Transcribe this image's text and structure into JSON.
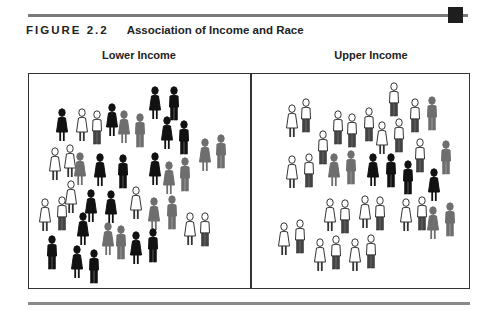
{
  "figure": {
    "number": "FIGURE 2.2",
    "title": "Association of Income and Race"
  },
  "colors": {
    "white": "#ffffff",
    "gray": "#6e6e6e",
    "black": "#111111",
    "outline": "#333333"
  },
  "panels": [
    {
      "label": "Lower Income",
      "people": [
        {
          "x": 62,
          "y": 108,
          "c": "black",
          "s": "dress"
        },
        {
          "x": 82,
          "y": 108,
          "c": "white",
          "s": "dress"
        },
        {
          "x": 97,
          "y": 110,
          "c": "white",
          "s": "pants"
        },
        {
          "x": 112,
          "y": 103,
          "c": "black",
          "s": "dress"
        },
        {
          "x": 124,
          "y": 110,
          "c": "gray",
          "s": "dress"
        },
        {
          "x": 140,
          "y": 113,
          "c": "gray",
          "s": "pants"
        },
        {
          "x": 155,
          "y": 86,
          "c": "black",
          "s": "dress"
        },
        {
          "x": 174,
          "y": 86,
          "c": "black",
          "s": "pants"
        },
        {
          "x": 167,
          "y": 116,
          "c": "black",
          "s": "dress"
        },
        {
          "x": 184,
          "y": 120,
          "c": "black",
          "s": "pants"
        },
        {
          "x": 205,
          "y": 138,
          "c": "gray",
          "s": "dress"
        },
        {
          "x": 221,
          "y": 134,
          "c": "gray",
          "s": "pants"
        },
        {
          "x": 55,
          "y": 147,
          "c": "white",
          "s": "dress"
        },
        {
          "x": 70,
          "y": 144,
          "c": "white",
          "s": "dress"
        },
        {
          "x": 80,
          "y": 152,
          "c": "gray",
          "s": "dress"
        },
        {
          "x": 100,
          "y": 153,
          "c": "black",
          "s": "dress"
        },
        {
          "x": 123,
          "y": 154,
          "c": "black",
          "s": "pants"
        },
        {
          "x": 155,
          "y": 152,
          "c": "black",
          "s": "dress"
        },
        {
          "x": 169,
          "y": 161,
          "c": "gray",
          "s": "dress"
        },
        {
          "x": 185,
          "y": 157,
          "c": "gray",
          "s": "pants"
        },
        {
          "x": 71,
          "y": 180,
          "c": "white",
          "s": "dress"
        },
        {
          "x": 91,
          "y": 189,
          "c": "black",
          "s": "dress"
        },
        {
          "x": 111,
          "y": 190,
          "c": "black",
          "s": "dress"
        },
        {
          "x": 136,
          "y": 186,
          "c": "white",
          "s": "dress"
        },
        {
          "x": 45,
          "y": 198,
          "c": "white",
          "s": "dress"
        },
        {
          "x": 62,
          "y": 196,
          "c": "white",
          "s": "pants"
        },
        {
          "x": 154,
          "y": 197,
          "c": "gray",
          "s": "dress"
        },
        {
          "x": 172,
          "y": 195,
          "c": "gray",
          "s": "pants"
        },
        {
          "x": 83,
          "y": 212,
          "c": "black",
          "s": "dress"
        },
        {
          "x": 108,
          "y": 222,
          "c": "gray",
          "s": "dress"
        },
        {
          "x": 121,
          "y": 225,
          "c": "gray",
          "s": "pants"
        },
        {
          "x": 136,
          "y": 231,
          "c": "black",
          "s": "dress"
        },
        {
          "x": 153,
          "y": 228,
          "c": "black",
          "s": "pants"
        },
        {
          "x": 190,
          "y": 212,
          "c": "white",
          "s": "dress"
        },
        {
          "x": 205,
          "y": 212,
          "c": "white",
          "s": "pants"
        },
        {
          "x": 52,
          "y": 235,
          "c": "black",
          "s": "pants"
        },
        {
          "x": 77,
          "y": 245,
          "c": "black",
          "s": "dress"
        },
        {
          "x": 94,
          "y": 249,
          "c": "black",
          "s": "pants"
        }
      ]
    },
    {
      "label": "Upper Income",
      "people": [
        {
          "x": 394,
          "y": 82,
          "c": "white",
          "s": "pants"
        },
        {
          "x": 292,
          "y": 104,
          "c": "white",
          "s": "dress"
        },
        {
          "x": 306,
          "y": 98,
          "c": "white",
          "s": "pants"
        },
        {
          "x": 415,
          "y": 98,
          "c": "white",
          "s": "pants"
        },
        {
          "x": 432,
          "y": 96,
          "c": "gray",
          "s": "pants"
        },
        {
          "x": 338,
          "y": 110,
          "c": "white",
          "s": "pants"
        },
        {
          "x": 352,
          "y": 113,
          "c": "white",
          "s": "pants"
        },
        {
          "x": 369,
          "y": 107,
          "c": "white",
          "s": "pants"
        },
        {
          "x": 382,
          "y": 121,
          "c": "white",
          "s": "dress"
        },
        {
          "x": 399,
          "y": 118,
          "c": "white",
          "s": "pants"
        },
        {
          "x": 323,
          "y": 130,
          "c": "white",
          "s": "pants"
        },
        {
          "x": 373,
          "y": 153,
          "c": "black",
          "s": "dress"
        },
        {
          "x": 391,
          "y": 153,
          "c": "black",
          "s": "pants"
        },
        {
          "x": 420,
          "y": 138,
          "c": "white",
          "s": "pants"
        },
        {
          "x": 334,
          "y": 153,
          "c": "gray",
          "s": "dress"
        },
        {
          "x": 351,
          "y": 150,
          "c": "gray",
          "s": "pants"
        },
        {
          "x": 292,
          "y": 155,
          "c": "white",
          "s": "dress"
        },
        {
          "x": 309,
          "y": 153,
          "c": "white",
          "s": "pants"
        },
        {
          "x": 408,
          "y": 160,
          "c": "black",
          "s": "pants"
        },
        {
          "x": 446,
          "y": 140,
          "c": "gray",
          "s": "pants"
        },
        {
          "x": 434,
          "y": 168,
          "c": "black",
          "s": "dress"
        },
        {
          "x": 330,
          "y": 198,
          "c": "white",
          "s": "dress"
        },
        {
          "x": 345,
          "y": 199,
          "c": "white",
          "s": "pants"
        },
        {
          "x": 365,
          "y": 195,
          "c": "white",
          "s": "dress"
        },
        {
          "x": 380,
          "y": 196,
          "c": "white",
          "s": "pants"
        },
        {
          "x": 406,
          "y": 198,
          "c": "white",
          "s": "dress"
        },
        {
          "x": 422,
          "y": 196,
          "c": "white",
          "s": "pants"
        },
        {
          "x": 433,
          "y": 206,
          "c": "gray",
          "s": "dress"
        },
        {
          "x": 450,
          "y": 202,
          "c": "gray",
          "s": "pants"
        },
        {
          "x": 284,
          "y": 222,
          "c": "white",
          "s": "dress"
        },
        {
          "x": 300,
          "y": 219,
          "c": "white",
          "s": "pants"
        },
        {
          "x": 320,
          "y": 238,
          "c": "white",
          "s": "dress"
        },
        {
          "x": 336,
          "y": 235,
          "c": "white",
          "s": "pants"
        },
        {
          "x": 355,
          "y": 238,
          "c": "white",
          "s": "dress"
        },
        {
          "x": 371,
          "y": 234,
          "c": "white",
          "s": "pants"
        }
      ]
    }
  ]
}
